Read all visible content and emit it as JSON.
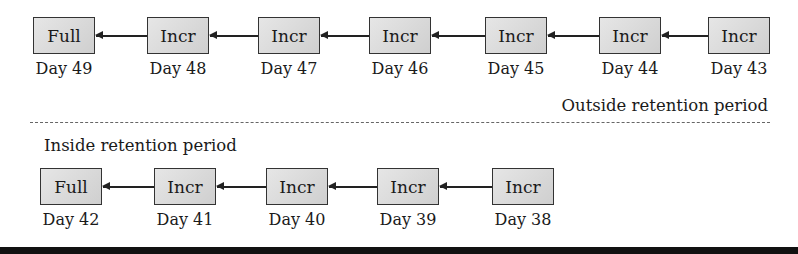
{
  "outside": {
    "label": "Outside retention period",
    "chain": [
      {
        "type": "Full",
        "day": "Day 49"
      },
      {
        "type": "Incr",
        "day": "Day 48"
      },
      {
        "type": "Incr",
        "day": "Day 47"
      },
      {
        "type": "Incr",
        "day": "Day 46"
      },
      {
        "type": "Incr",
        "day": "Day 45"
      },
      {
        "type": "Incr",
        "day": "Day 44"
      },
      {
        "type": "Incr",
        "day": "Day 43"
      }
    ]
  },
  "inside": {
    "label": "Inside retention period",
    "chain": [
      {
        "type": "Full",
        "day": "Day 42"
      },
      {
        "type": "Incr",
        "day": "Day 41"
      },
      {
        "type": "Incr",
        "day": "Day 40"
      },
      {
        "type": "Incr",
        "day": "Day 39"
      },
      {
        "type": "Incr",
        "day": "Day 38"
      }
    ]
  }
}
